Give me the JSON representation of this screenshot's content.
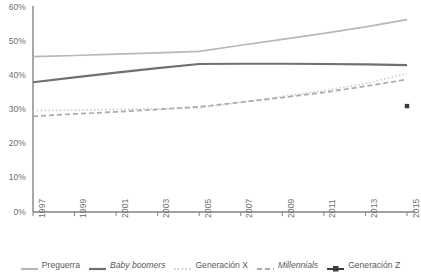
{
  "chart_data": {
    "type": "line",
    "title": "",
    "xlabel": "",
    "ylabel": "",
    "x": [
      1997,
      1999,
      2001,
      2003,
      2005,
      2007,
      2009,
      2011,
      2013,
      2015
    ],
    "xlim": [
      1997,
      2015
    ],
    "ylim": [
      0,
      60
    ],
    "ytick_labels": [
      "0%",
      "10%",
      "20%",
      "30%",
      "40%",
      "50%",
      "60%"
    ],
    "ytick_values": [
      0,
      10,
      20,
      30,
      40,
      50,
      60
    ],
    "xtick_labels": [
      "1997",
      "1999",
      "2001",
      "2003",
      "2005",
      "2007",
      "2009",
      "2011",
      "2013",
      "2015"
    ],
    "grid": false,
    "legend_position": "bottom",
    "series": [
      {
        "name": "Preguerra",
        "style": "solid",
        "color": "#b8b8ba",
        "italic": false,
        "x": [
          1997,
          1999,
          2001,
          2003,
          2005,
          2007,
          2009,
          2011,
          2013,
          2015
        ],
        "values": [
          45.5,
          45.8,
          46.2,
          46.6,
          47.0,
          48.8,
          50.5,
          52.3,
          54.2,
          56.3
        ]
      },
      {
        "name": "Baby boomers",
        "style": "solid",
        "color": "#6f7072",
        "italic": true,
        "x": [
          1997,
          1999,
          2001,
          2003,
          2005,
          2007,
          2009,
          2011,
          2013,
          2015
        ],
        "values": [
          38.0,
          39.4,
          40.8,
          42.1,
          43.3,
          43.4,
          43.4,
          43.3,
          43.2,
          43.0
        ]
      },
      {
        "name": "Generación X",
        "style": "dotted",
        "color": "#cfd0d2",
        "italic": false,
        "x": [
          1997,
          1999,
          2001,
          2003,
          2005,
          2007,
          2009,
          2011,
          2013,
          2015
        ],
        "values": [
          29.7,
          29.8,
          30.0,
          30.2,
          30.5,
          32.1,
          33.8,
          35.5,
          37.6,
          40.5
        ]
      },
      {
        "name": "Millennials",
        "style": "dashed",
        "color": "#a9aaac",
        "italic": true,
        "x": [
          1997,
          1999,
          2001,
          2003,
          2005,
          2007,
          2009,
          2011,
          2013,
          2015
        ],
        "values": [
          28.0,
          28.7,
          29.3,
          30.0,
          30.8,
          32.1,
          33.5,
          35.0,
          36.8,
          38.8
        ]
      },
      {
        "name": "Generación Z",
        "style": "marker",
        "color": "#3b3b3d",
        "italic": false,
        "x": [
          2015
        ],
        "values": [
          31.0
        ]
      }
    ]
  },
  "legend": {
    "items": [
      {
        "label": "Preguerra"
      },
      {
        "label": "Baby boomers"
      },
      {
        "label": "Generación X"
      },
      {
        "label": "Millennials"
      },
      {
        "label": "Generación Z"
      }
    ]
  },
  "axes": {
    "axis_color": "#808285"
  }
}
